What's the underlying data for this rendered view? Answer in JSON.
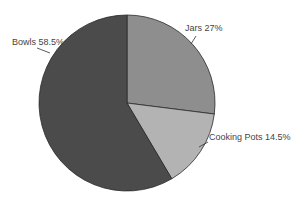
{
  "chart_data": {
    "type": "pie",
    "title": "",
    "start_angle_deg": 0,
    "direction": "clockwise",
    "slices": [
      {
        "label": "Jars",
        "value": 27,
        "display": "Jars 27%",
        "color": "#8e8e8e"
      },
      {
        "label": "Cooking Pots",
        "value": 14.5,
        "display": "Cooking Pots 14.5%",
        "color": "#b3b3b3"
      },
      {
        "label": "Bowls",
        "value": 58.5,
        "display": "Bowls 58.5%",
        "color": "#4b4b4b"
      }
    ],
    "categories": [
      "Jars",
      "Cooking Pots",
      "Bowls"
    ],
    "values": [
      27,
      14.5,
      58.5
    ],
    "units": "%",
    "legend": "none (inline labels with leader lines)"
  }
}
